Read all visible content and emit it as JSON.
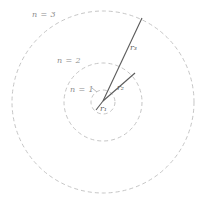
{
  "diagram": {
    "type": "bohr-model-orbits",
    "orbit_labels": [
      {
        "n": 1,
        "label": "n = 1"
      },
      {
        "n": 2,
        "label": "n = 2"
      },
      {
        "n": 3,
        "label": "n = 3"
      }
    ],
    "radius_labels": [
      {
        "label": "r₁"
      },
      {
        "label": "r₂"
      },
      {
        "label": "r₃"
      }
    ],
    "colors": {
      "orbit_stroke": "#c6c6c6",
      "radius_stroke": "#5a5a5a",
      "orbit_label_text": "#8c8c8c",
      "radius_label_text": "#636363",
      "background": "#ffffff"
    }
  }
}
